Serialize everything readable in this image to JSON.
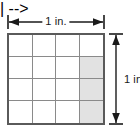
{
  "dimensions": {
    "top": {
      "label": "1 in.",
      "orientation": "horizontal",
      "icon_left": "arrow-left-icon",
      "icon_right": "arrow-right-icon"
    },
    "right": {
      "label": "1 in.",
      "orientation": "vertical",
      "icon_top": "arrow-up-icon",
      "icon_bottom": "arrow-down-icon"
    }
  },
  "grid": {
    "rows": 4,
    "columns": 4,
    "total_cells": 16,
    "shaded_cells": 3,
    "shaded_fraction": "3/16",
    "border_color": "#5a5a5a",
    "line_color": "#8a8a8a",
    "cell_fill": "#ffffff",
    "shaded_fill": "#e2e2e2",
    "cells": [
      [
        {
          "shaded": false
        },
        {
          "shaded": false
        },
        {
          "shaded": false
        },
        {
          "shaded": false
        }
      ],
      [
        {
          "shaded": false
        },
        {
          "shaded": false
        },
        {
          "shaded": false
        },
        {
          "shaded": true
        }
      ],
      [
        {
          "shaded": false
        },
        {
          "shaded": false
        },
        {
          "shaded": false
        },
        {
          "shaded": true
        }
      ],
      [
        {
          "shaded": false
        },
        {
          "shaded": false
        },
        {
          "shaded": false
        },
        {
          "shaded": true
        }
      ]
    ]
  }
}
